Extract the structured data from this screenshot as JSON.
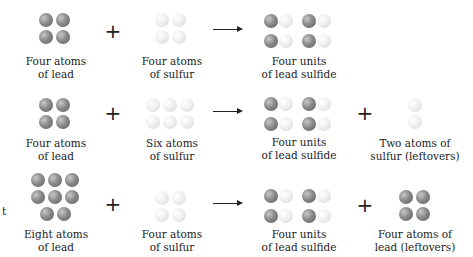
{
  "rows": [
    {
      "reactant1": {
        "label_line1": "Four atoms",
        "label_line2": "of lead",
        "count": 4,
        "element": "lead"
      },
      "operator1": "+",
      "reactant2": {
        "label_line1": "Four atoms",
        "label_line2": "of sulfur",
        "count": 4,
        "element": "sulfur"
      },
      "product1": {
        "label_line1": "Four units",
        "label_line2": "of lead sulfide",
        "count": 4,
        "element": "lead sulfide"
      }
    },
    {
      "reactant1": {
        "label_line1": "Four atoms",
        "label_line2": "of lead",
        "count": 4,
        "element": "lead"
      },
      "operator1": "+",
      "reactant2": {
        "label_line1": "Six atoms",
        "label_line2": "of sulfur",
        "count": 6,
        "element": "sulfur"
      },
      "product1": {
        "label_line1": "Four units",
        "label_line2": "of lead sulfide",
        "count": 4,
        "element": "lead sulfide"
      },
      "operator2": "+",
      "product2": {
        "label_line1": "Two atoms of",
        "label_line2": "sulfur (leftovers)",
        "count": 2,
        "element": "sulfur"
      }
    },
    {
      "reactant1": {
        "label_line1": "Eight atoms",
        "label_line2": "of lead",
        "count": 8,
        "element": "lead"
      },
      "operator1": "+",
      "reactant2": {
        "label_line1": "Four atoms",
        "label_line2": "of sulfur",
        "count": 4,
        "element": "sulfur"
      },
      "product1": {
        "label_line1": "Four units",
        "label_line2": "of lead sulfide",
        "count": 4,
        "element": "lead sulfide"
      },
      "operator2": "+",
      "product2": {
        "label_line1": "Four atoms of",
        "label_line2": "lead (leftovers)",
        "count": 4,
        "element": "lead"
      }
    }
  ],
  "margin_fragment": "t",
  "colors": {
    "lead": "#7a7a7a",
    "sulfur": "#e8e8e8",
    "text": "#222222"
  }
}
